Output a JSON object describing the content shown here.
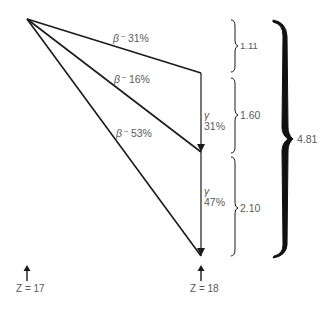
{
  "diagram": {
    "type": "decay-scheme",
    "parent_label": "Z = 17",
    "daughter_label": "Z = 18",
    "beta_branches": [
      {
        "label": "β⁻",
        "percent": "31%"
      },
      {
        "label": "β⁻",
        "percent": "16%"
      },
      {
        "label": "β⁻",
        "percent": "53%"
      }
    ],
    "gamma_transitions": [
      {
        "label": "γ",
        "percent": "31%"
      },
      {
        "label": "γ",
        "percent": "47%"
      }
    ],
    "energy_gaps": [
      "1.11",
      "1.60",
      "2.10"
    ],
    "total_energy": "4.81"
  }
}
